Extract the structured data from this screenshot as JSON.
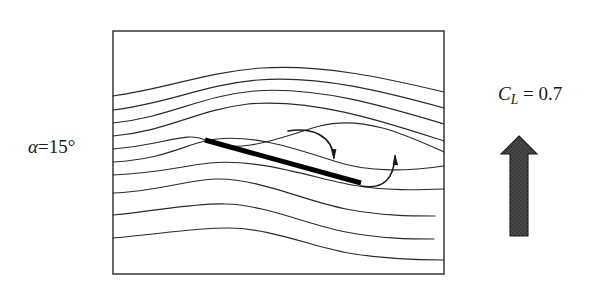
{
  "figure": {
    "background_color": "#ffffff",
    "line_color": "#2a2a2a",
    "plate_color": "#000000",
    "arrow_fill_color": "#474747",
    "arrow_edge_color": "#1a1a1a"
  },
  "labels": {
    "alpha": {
      "symbol": "α",
      "equals": "=",
      "value": "15",
      "unit": "°",
      "full_text": "α=15°"
    },
    "lift_coefficient": {
      "symbol": "C",
      "subscript": "L",
      "equals": "=",
      "value": "0.7",
      "full_text": "C_L = 0.7"
    }
  },
  "domain_box": {
    "x": 113,
    "y": 31,
    "width": 331,
    "height": 243,
    "stroke": "#2a2a2a",
    "stroke_width": 1.4,
    "fill": "none"
  },
  "plate": {
    "name": "flat-plate-airfoil",
    "leading_edge": [
      205,
      140
    ],
    "trailing_edge": [
      361,
      183
    ],
    "thickness": 5,
    "angle_of_attack_deg": 15,
    "color": "#000000"
  },
  "circulation_arrows": [
    {
      "name": "upper-surface-circulation-arrow",
      "direction": "clockwise-downward",
      "path": "M 288 131 C 313 127 332 136 334 158",
      "head_at": [
        334,
        160
      ],
      "head_angle_deg": 95
    },
    {
      "name": "lower-surface-circulation-arrow",
      "direction": "counterclockwise-upward",
      "path": "M 361 186 C 384 190 394 178 395 156",
      "head_at": [
        395,
        154
      ],
      "head_angle_deg": -85
    }
  ],
  "lift_arrow": {
    "name": "lift-vector-arrow",
    "direction": "up",
    "shaft_x": 510,
    "shaft_width": 18,
    "shaft_top": 153,
    "shaft_bottom": 236,
    "head_tip": [
      519,
      136
    ],
    "head_left": 501,
    "head_right": 537,
    "head_base_y": 154,
    "fill": "#474747",
    "stroke": "#1a1a1a"
  },
  "chart_data": {
    "type": "line",
    "xlabel": "",
    "ylabel": "",
    "xlim": [
      113,
      444
    ],
    "ylim": [
      31,
      274
    ],
    "grid": false,
    "legend": "none",
    "annotations": [
      "α=15°",
      "C_L = 0.7"
    ],
    "series": [
      {
        "name": "streamline-1",
        "path": "M 113 96 C 170 88 205 72 262 68 C 322 64 385 78 444 92"
      },
      {
        "name": "streamline-2",
        "path": "M 113 110 C 170 103 202 85 258 80 C 320 75 386 92 444 108"
      },
      {
        "name": "streamline-3",
        "path": "M 113 123 C 170 117 200 96 254 91 C 318 86 387 107 444 124"
      },
      {
        "name": "streamline-4",
        "path": "M 113 136 C 168 131 197 110 248 104 C 315 98 388 123 444 141"
      },
      {
        "name": "streamline-5",
        "path": "M 113 149 C 165 145 186 131 205 140 C 240 157 286 135 320 126 C 362 115 404 134 444 152"
      },
      {
        "name": "streamline-6",
        "path": "M 113 162 C 163 159 183 146 205 141 C 247 131 300 150 334 161 C 370 173 408 171 444 166"
      },
      {
        "name": "streamline-7",
        "path": "M 113 175 C 160 173 182 166 210 163 C 258 158 314 178 352 185 C 387 191 416 190 444 189"
      },
      {
        "name": "streamline-8",
        "path": "M 113 193 C 155 192 186 180 216 179 C 258 178 304 201 346 209 C 382 216 412 216 435 216"
      },
      {
        "name": "streamline-9",
        "path": "M 113 215 C 158 211 192 203 226 204 C 266 205 308 225 346 232 C 382 239 412 239 434 239"
      },
      {
        "name": "streamline-10",
        "path": "M 113 238 C 160 234 192 228 228 228 C 270 228 310 246 348 253 C 384 259 416 260 444 260"
      }
    ]
  }
}
